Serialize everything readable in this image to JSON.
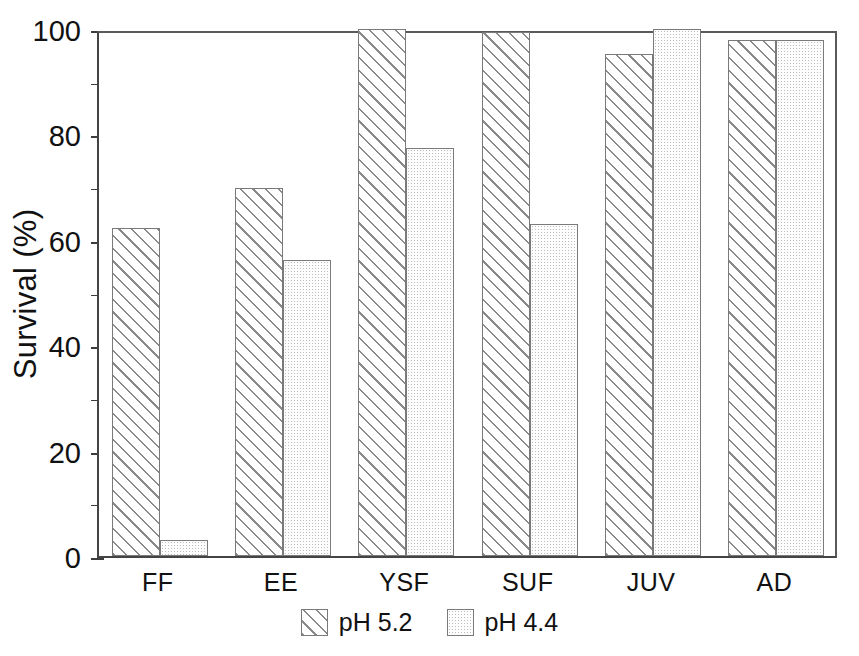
{
  "chart_data": {
    "type": "bar",
    "title": "",
    "subtitle": "",
    "xlabel": "",
    "ylabel": "Survival (%)",
    "categories": [
      "FF",
      "EE",
      "YSF",
      "SUF",
      "JUV",
      "AD"
    ],
    "series": [
      {
        "name": "pH 5.2",
        "pattern": "diagonal-hatch",
        "values": [
          62.3,
          69.8,
          100.0,
          99.5,
          95.3,
          98.0
        ]
      },
      {
        "name": "pH 4.4",
        "pattern": "stipple-dots",
        "values": [
          3.0,
          56.2,
          77.5,
          63.0,
          100.0,
          98.0
        ]
      }
    ],
    "ylim": [
      0,
      100
    ],
    "ytick_major": [
      0,
      20,
      40,
      60,
      80,
      100
    ],
    "ytick_minor": [
      10,
      30,
      50,
      70,
      90
    ],
    "ytick_labels": [
      "0",
      "20",
      "40",
      "60",
      "80",
      "100"
    ],
    "grid": false,
    "legend_position": "bottom-center",
    "legend_entries": [
      "pH 5.2",
      "pH 4.4"
    ],
    "colors": {
      "axis": "#3d3d3d",
      "bar_outline": "#7a7a7a",
      "hatch_line": "#8a8a8a",
      "stipple_dot": "#bdbdbd",
      "background": "#ffffff",
      "text": "#111111"
    }
  }
}
